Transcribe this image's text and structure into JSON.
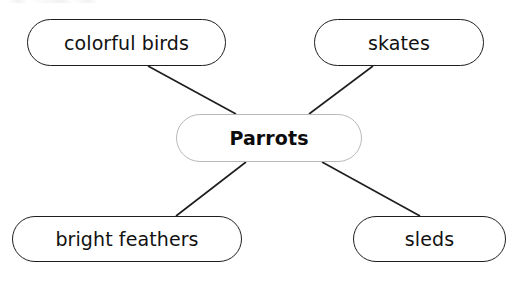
{
  "diagram": {
    "type": "mind-map",
    "center": {
      "label": "Parrots",
      "border_color": "#b9b9b9",
      "bold": true
    },
    "nodes": [
      {
        "id": "top-left",
        "label": "colorful birds"
      },
      {
        "id": "top-right",
        "label": "skates"
      },
      {
        "id": "bottom-left",
        "label": "bright feathers"
      },
      {
        "id": "bottom-right",
        "label": "sleds"
      }
    ],
    "connections": [
      {
        "from": "Parrots",
        "to": "colorful birds"
      },
      {
        "from": "Parrots",
        "to": "skates"
      },
      {
        "from": "Parrots",
        "to": "bright feathers"
      },
      {
        "from": "Parrots",
        "to": "sleds"
      }
    ],
    "colors": {
      "line": "#1e1e1e",
      "node_border": "#1e1e1e",
      "text": "#111111",
      "background": "#ffffff"
    }
  }
}
